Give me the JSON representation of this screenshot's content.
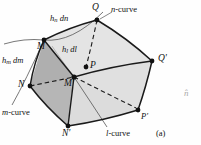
{
  "figure": {
    "caption": "(a)",
    "vertices": [
      {
        "id": "Q",
        "label": "Q",
        "x": 97,
        "y": 20
      },
      {
        "id": "M",
        "label": "M",
        "x": 44,
        "y": 40
      },
      {
        "id": "Qp",
        "label": "Q'",
        "x": 152,
        "y": 61
      },
      {
        "id": "P",
        "label": "P",
        "x": 86,
        "y": 67
      },
      {
        "id": "N",
        "label": "N",
        "x": 30,
        "y": 86
      },
      {
        "id": "Mp",
        "label": "M'",
        "x": 74,
        "y": 77
      },
      {
        "id": "Pp",
        "label": "P'",
        "x": 138,
        "y": 110
      },
      {
        "id": "Np",
        "label": "N'",
        "x": 68,
        "y": 126
      }
    ],
    "edge_labels": [
      {
        "id": "hn_dn",
        "base": "h",
        "sub": "n",
        "diff": "dn",
        "x": 50,
        "y": 16
      },
      {
        "id": "hl_dl",
        "base": "h",
        "sub": "l",
        "diff": "dl",
        "x": 62,
        "y": 47
      },
      {
        "id": "hm_dm",
        "base": "h",
        "sub": "m",
        "diff": "dm",
        "x": 2,
        "y": 58
      }
    ],
    "curve_labels": [
      {
        "id": "n-curve",
        "letter": "n",
        "text": "-curve",
        "x": 112,
        "y": 10
      },
      {
        "id": "m-curve",
        "letter": "m",
        "text": "-curve",
        "x": 2,
        "y": 110
      },
      {
        "id": "l-curve",
        "letter": "l",
        "text": "-curve",
        "x": 108,
        "y": 131
      }
    ],
    "margin_mark": {
      "id": "n-hat",
      "text": "n̂",
      "x": 184,
      "y": 95
    },
    "colors": {
      "fill_light": "#e2e2e2",
      "fill_mid": "#d2d2d2",
      "fill_dark": "#b4b4b4",
      "stroke": "#1a1a1a",
      "stroke_thin": "#4a4a4a",
      "text": "#111111"
    }
  }
}
